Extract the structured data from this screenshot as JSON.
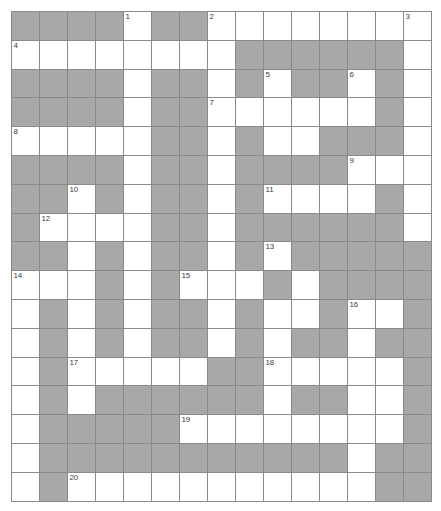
{
  "puzzle": {
    "type": "crossword-grid",
    "title": "Crossword Puzzle Grid",
    "columns": 15,
    "rows": 17,
    "cell_width": 28,
    "cell_height": 28.8,
    "colors": {
      "background": "#ffffff",
      "open_cell": "#ffffff",
      "blocked_cell": "#a8a8a8",
      "grid_line": "#8a8a8a",
      "number_text": "#3c3c3c"
    },
    "legend": {
      "shaded_meaning": "blocked cell",
      "open_meaning": "letter cell"
    },
    "clue_numbers": [
      {
        "n": "1",
        "row": 0,
        "col": 4
      },
      {
        "n": "2",
        "row": 0,
        "col": 7
      },
      {
        "n": "3",
        "row": 0,
        "col": 14
      },
      {
        "n": "4",
        "row": 1,
        "col": 0
      },
      {
        "n": "5",
        "row": 2,
        "col": 9
      },
      {
        "n": "6",
        "row": 2,
        "col": 12
      },
      {
        "n": "7",
        "row": 3,
        "col": 7
      },
      {
        "n": "8",
        "row": 4,
        "col": 0
      },
      {
        "n": "9",
        "row": 5,
        "col": 12
      },
      {
        "n": "10",
        "row": 6,
        "col": 2
      },
      {
        "n": "11",
        "row": 6,
        "col": 9
      },
      {
        "n": "12",
        "row": 7,
        "col": 1
      },
      {
        "n": "13",
        "row": 8,
        "col": 9
      },
      {
        "n": "14",
        "row": 9,
        "col": 0
      },
      {
        "n": "15",
        "row": 9,
        "col": 6
      },
      {
        "n": "16",
        "row": 10,
        "col": 12
      },
      {
        "n": "17",
        "row": 12,
        "col": 2
      },
      {
        "n": "18",
        "row": 12,
        "col": 9
      },
      {
        "n": "19",
        "row": 14,
        "col": 6
      },
      {
        "n": "20",
        "row": 16,
        "col": 2
      }
    ],
    "grid": [
      [
        1,
        1,
        1,
        1,
        0,
        1,
        1,
        0,
        0,
        0,
        0,
        0,
        0,
        0,
        0
      ],
      [
        0,
        0,
        0,
        0,
        0,
        0,
        0,
        0,
        1,
        1,
        1,
        1,
        1,
        1,
        0
      ],
      [
        1,
        1,
        1,
        1,
        0,
        1,
        1,
        0,
        1,
        0,
        1,
        1,
        0,
        1,
        0
      ],
      [
        1,
        1,
        1,
        1,
        0,
        1,
        1,
        0,
        0,
        0,
        0,
        0,
        0,
        1,
        0
      ],
      [
        0,
        0,
        0,
        0,
        0,
        1,
        1,
        0,
        1,
        0,
        0,
        1,
        1,
        1,
        0
      ],
      [
        1,
        1,
        1,
        1,
        0,
        1,
        1,
        0,
        1,
        1,
        1,
        1,
        0,
        0,
        0
      ],
      [
        1,
        1,
        0,
        1,
        0,
        1,
        1,
        0,
        1,
        0,
        0,
        0,
        0,
        1,
        0
      ],
      [
        1,
        0,
        0,
        0,
        0,
        1,
        1,
        0,
        1,
        1,
        1,
        1,
        1,
        1,
        0
      ],
      [
        1,
        1,
        0,
        1,
        0,
        1,
        1,
        0,
        1,
        0,
        1,
        1,
        1,
        1,
        1
      ],
      [
        0,
        0,
        0,
        1,
        0,
        1,
        0,
        0,
        0,
        1,
        0,
        1,
        1,
        1,
        1
      ],
      [
        0,
        1,
        0,
        1,
        0,
        1,
        1,
        0,
        1,
        0,
        0,
        1,
        0,
        0,
        1
      ],
      [
        0,
        1,
        0,
        1,
        0,
        1,
        1,
        0,
        1,
        0,
        1,
        1,
        0,
        1,
        1
      ],
      [
        0,
        1,
        0,
        0,
        0,
        0,
        0,
        1,
        1,
        0,
        0,
        0,
        0,
        0,
        1
      ],
      [
        0,
        1,
        0,
        1,
        1,
        1,
        1,
        1,
        1,
        0,
        1,
        1,
        0,
        0,
        1
      ],
      [
        0,
        1,
        1,
        1,
        1,
        1,
        0,
        0,
        0,
        0,
        0,
        0,
        0,
        0,
        1
      ],
      [
        0,
        1,
        1,
        1,
        1,
        1,
        1,
        1,
        1,
        1,
        1,
        1,
        0,
        1,
        1
      ],
      [
        0,
        1,
        0,
        0,
        0,
        0,
        0,
        0,
        0,
        0,
        0,
        0,
        0,
        1,
        1
      ]
    ]
  }
}
